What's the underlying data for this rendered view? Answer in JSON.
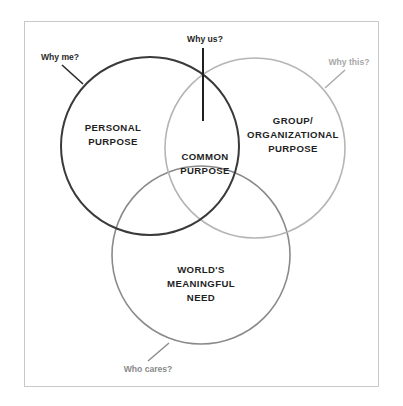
{
  "diagram": {
    "type": "venn",
    "circles": [
      {
        "id": "personal",
        "label": "PERSONAL\nPURPOSE",
        "question": "Why me?",
        "stroke": "#3a3a3a",
        "cx": 150,
        "cy": 146,
        "r": 89
      },
      {
        "id": "group",
        "label": "GROUP/\nORGANIZATIONAL\nPURPOSE",
        "question": "Why this?",
        "stroke": "#b5b5b5",
        "cx": 255,
        "cy": 148,
        "r": 90
      },
      {
        "id": "world",
        "label": "WORLD'S\nMEANINGFUL\nNEED",
        "question": "Who cares?",
        "stroke": "#8a8a8a",
        "cx": 201,
        "cy": 255,
        "r": 89
      }
    ],
    "intersection": {
      "label": "COMMON\nPURPOSE",
      "question": "Why us?"
    },
    "colors": {
      "dark_text": "#1f1f1f",
      "why_me": "#2a2a2a",
      "why_this": "#a8a8a8",
      "who_cares": "#8a8a8a",
      "why_us": "#1f1f1f",
      "frame": "#c9c9c9"
    }
  }
}
